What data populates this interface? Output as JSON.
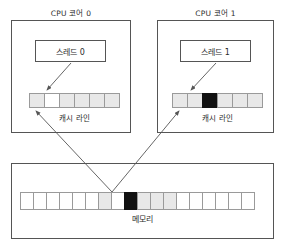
{
  "diagram": {
    "title_semantic": "false-sharing-cache-coherency-diagram",
    "colors": {
      "cell_white": "#ffffff",
      "cell_gray": "#e8e8e8",
      "cell_black": "#111111",
      "border": "#555555",
      "cell_border": "#9a9a9a",
      "arrow": "#555555",
      "text": "#2b2b2b",
      "background": "#ffffff"
    },
    "cores": [
      {
        "title": "CPU 코어 0",
        "thread_label": "스레드 0",
        "cache_label": "캐시 라인",
        "cache_cells": [
          "gray",
          "white",
          "gray",
          "gray",
          "gray",
          "gray"
        ]
      },
      {
        "title": "CPU 코어 1",
        "thread_label": "스레드 1",
        "cache_label": "캐시 라인",
        "cache_cells": [
          "gray",
          "gray",
          "black",
          "gray",
          "gray",
          "gray"
        ]
      }
    ],
    "memory": {
      "label": "메모리",
      "cells": [
        "white",
        "white",
        "white",
        "white",
        "white",
        "white",
        "gray",
        "white",
        "black",
        "gray",
        "gray",
        "gray",
        "white",
        "white",
        "white",
        "white",
        "white",
        "white"
      ]
    },
    "arrows": [
      {
        "name": "thread-0-to-cache-0",
        "from": "스레드 0",
        "to": "캐시 라인 (코어 0)",
        "x1": 71,
        "y1": 63,
        "x2": 47,
        "y2": 90
      },
      {
        "name": "thread-1-to-cache-1",
        "from": "스레드 1",
        "to": "캐시 라인 (코어 1)",
        "x1": 216,
        "y1": 63,
        "x2": 191,
        "y2": 90
      },
      {
        "name": "memory-to-cache-0",
        "from": "메모리",
        "to": "캐시 라인 (코어 0)",
        "x1": 112,
        "y1": 192,
        "x2": 36,
        "y2": 111
      },
      {
        "name": "memory-to-cache-1",
        "from": "메모리",
        "to": "캐시 라인 (코어 1)",
        "x1": 112,
        "y1": 192,
        "x2": 179,
        "y2": 111
      }
    ]
  }
}
